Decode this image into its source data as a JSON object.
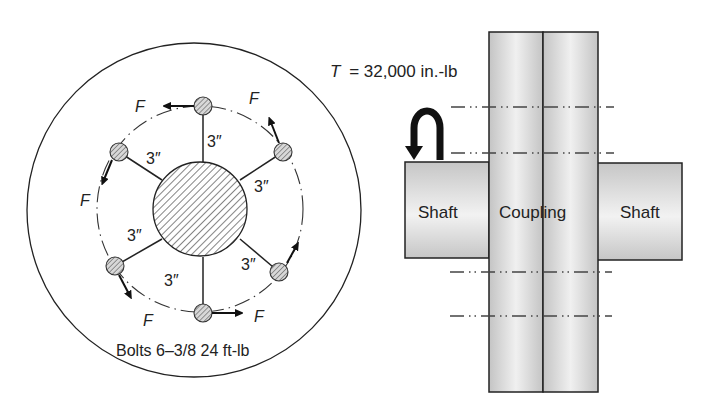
{
  "left_view": {
    "title": "Bolt circle end view",
    "bolt_label": "Bolts 6–3/8 24 ft-lb",
    "force_label": "F",
    "radius_label": "3″",
    "bolt_count": 6,
    "bolt_circle_radius_in": 3
  },
  "right_view": {
    "torque_label": "T = 32,000 in.-lb",
    "torque_symbol": "T",
    "torque_value": "= 32,000 in.-lb",
    "left_shaft_label": "Shaft",
    "coupling_label": "Coupling",
    "right_shaft_label": "Shaft"
  },
  "colors": {
    "line": "#222222",
    "fill_light": "#ededed",
    "fill_dark": "#bdbdbd",
    "bolt_fill": "#cfcfcf"
  }
}
